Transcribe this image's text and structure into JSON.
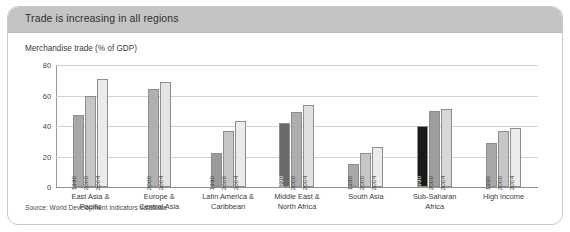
{
  "card": {
    "title": "Trade is increasing in all regions",
    "subtitle": "Merchandise trade (% of GDP)",
    "source": "Source: World Development Indicators database"
  },
  "colors": {
    "header_band": "#c4c4c4",
    "bar_1990": "#a8a8a8",
    "bar_1990_dark": "#1a1a1a",
    "bar_1990_mid": "#6b6b6b",
    "bar_2000": "#c6c6c6",
    "bar_2004": "#ebebeb",
    "gridline": "#d2d2d2",
    "axis": "#8f8f8f"
  },
  "chart_data": {
    "type": "bar",
    "title": "Trade is increasing in all regions",
    "subtitle": "Merchandise trade (% of GDP)",
    "xlabel": "",
    "ylabel": "Merchandise trade (% of GDP)",
    "ylim": [
      0,
      80
    ],
    "yticks": [
      0,
      20,
      40,
      60,
      80
    ],
    "grid": true,
    "legend_position": "in-bar",
    "categories": [
      "East Asia &\nPacific",
      "Europe &\nCentral Asia",
      "Latin America &\nCaribbean",
      "Middle East &\nNorth Africa",
      "South Asia",
      "Sub-Saharan\nAfrica",
      "High income"
    ],
    "series": [
      {
        "name": "1990",
        "values": [
          47,
          null,
          22,
          42,
          15,
          40,
          29
        ]
      },
      {
        "name": "2000",
        "values": [
          60,
          64,
          37,
          49,
          22,
          50,
          37
        ]
      },
      {
        "name": "2004",
        "values": [
          71,
          69,
          43,
          54,
          26,
          51,
          39
        ]
      }
    ],
    "groups": [
      {
        "label": "East Asia &\nPacific",
        "bars": [
          {
            "year": "1990",
            "value": 47,
            "shade": "#a8a8a8",
            "label_color": "light"
          },
          {
            "year": "2000",
            "value": 60,
            "shade": "#c6c6c6",
            "label_color": "light"
          },
          {
            "year": "2004",
            "value": 71,
            "shade": "#ebebeb",
            "label_color": "light"
          }
        ]
      },
      {
        "label": "Europe &\nCentral Asia",
        "bars": [
          {
            "year": "2000",
            "value": 64,
            "shade": "#b0b0b0",
            "label_color": "light"
          },
          {
            "year": "2004",
            "value": 69,
            "shade": "#e4e4e4",
            "label_color": "light"
          }
        ]
      },
      {
        "label": "Latin America &\nCaribbean",
        "bars": [
          {
            "year": "1990",
            "value": 22,
            "shade": "#9a9a9a",
            "label_color": "light"
          },
          {
            "year": "2000",
            "value": 37,
            "shade": "#c6c6c6",
            "label_color": "light"
          },
          {
            "year": "2004",
            "value": 43,
            "shade": "#ebebeb",
            "label_color": "light"
          }
        ]
      },
      {
        "label": "Middle East &\nNorth Africa",
        "bars": [
          {
            "year": "1990",
            "value": 42,
            "shade": "#6b6b6b",
            "label_color": "dark"
          },
          {
            "year": "2000",
            "value": 49,
            "shade": "#adadad",
            "label_color": "light"
          },
          {
            "year": "2004",
            "value": 54,
            "shade": "#e0e0e0",
            "label_color": "light"
          }
        ]
      },
      {
        "label": "South Asia",
        "bars": [
          {
            "year": "1990",
            "value": 15,
            "shade": "#a8a8a8",
            "label_color": "light"
          },
          {
            "year": "2000",
            "value": 22,
            "shade": "#c6c6c6",
            "label_color": "light"
          },
          {
            "year": "2004",
            "value": 26,
            "shade": "#ebebeb",
            "label_color": "light"
          }
        ]
      },
      {
        "label": "Sub-Saharan\nAfrica",
        "bars": [
          {
            "year": "1990",
            "value": 40,
            "shade": "#1a1a1a",
            "label_color": "dark"
          },
          {
            "year": "2000",
            "value": 50,
            "shade": "#9e9e9e",
            "label_color": "light"
          },
          {
            "year": "2004",
            "value": 51,
            "shade": "#d8d8d8",
            "label_color": "light"
          }
        ]
      },
      {
        "label": "High income",
        "bars": [
          {
            "year": "1990",
            "value": 29,
            "shade": "#a8a8a8",
            "label_color": "light"
          },
          {
            "year": "2000",
            "value": 37,
            "shade": "#c6c6c6",
            "label_color": "light"
          },
          {
            "year": "2004",
            "value": 39,
            "shade": "#ebebeb",
            "label_color": "light"
          }
        ]
      }
    ]
  }
}
